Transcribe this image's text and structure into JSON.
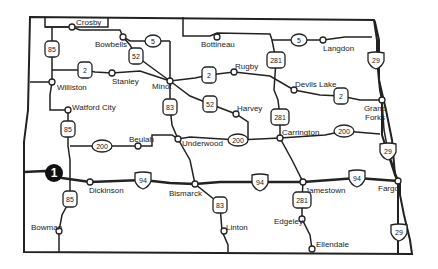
{
  "map": {
    "title": "North Dakota highway map",
    "marker": {
      "label": "1",
      "x": 54,
      "y": 173
    },
    "cities": [
      {
        "name": "Crosby",
        "x": 72,
        "y": 27,
        "lx": 76,
        "ly": 18
      },
      {
        "name": "Bowbells",
        "x": 123,
        "y": 37,
        "lx": 95,
        "ly": 40
      },
      {
        "name": "Bottineau",
        "x": 217,
        "y": 37,
        "lx": 201,
        "ly": 40
      },
      {
        "name": "Langdon",
        "x": 323,
        "y": 40,
        "lx": 323,
        "ly": 44
      },
      {
        "name": "Williston",
        "x": 52,
        "y": 82,
        "lx": 57,
        "ly": 83
      },
      {
        "name": "Stanley",
        "x": 112,
        "y": 73,
        "lx": 112,
        "ly": 77
      },
      {
        "name": "Minot",
        "x": 170,
        "y": 81,
        "lx": 152,
        "ly": 82
      },
      {
        "name": "Rugby",
        "x": 234,
        "y": 72,
        "lx": 235,
        "ly": 62
      },
      {
        "name": "Devils Lake",
        "x": 294,
        "y": 90,
        "lx": 295,
        "ly": 80
      },
      {
        "name": "Grand Forks",
        "x": 382,
        "y": 100,
        "lx": 361,
        "ly": 104
      },
      {
        "name": "Watford City",
        "x": 68,
        "y": 110,
        "lx": 72,
        "ly": 103
      },
      {
        "name": "Harvey",
        "x": 236,
        "y": 114,
        "lx": 237,
        "ly": 104
      },
      {
        "name": "Carrington",
        "x": 280,
        "y": 138,
        "lx": 282,
        "ly": 128
      },
      {
        "name": "Beulah",
        "x": 138,
        "y": 146,
        "lx": 129,
        "ly": 135
      },
      {
        "name": "Underwood",
        "x": 178,
        "y": 139,
        "lx": 182,
        "ly": 139
      },
      {
        "name": "Dickinson",
        "x": 90,
        "y": 182,
        "lx": 89,
        "ly": 186
      },
      {
        "name": "Bismarck",
        "x": 195,
        "y": 184,
        "lx": 169,
        "ly": 189
      },
      {
        "name": "Jamestown",
        "x": 303,
        "y": 182,
        "lx": 305,
        "ly": 186
      },
      {
        "name": "Fargo",
        "x": 398,
        "y": 181,
        "lx": 378,
        "ly": 184
      },
      {
        "name": "Bowman",
        "x": 59,
        "y": 231,
        "lx": 31,
        "ly": 223
      },
      {
        "name": "Linton",
        "x": 224,
        "y": 231,
        "lx": 226,
        "ly": 223
      },
      {
        "name": "Edgeley",
        "x": 302,
        "y": 219,
        "lx": 274,
        "ly": 217
      },
      {
        "name": "Ellendale",
        "x": 312,
        "y": 249,
        "lx": 316,
        "ly": 240
      }
    ],
    "shields": [
      {
        "route": "85",
        "type": "us",
        "x": 52,
        "y": 49
      },
      {
        "route": "85",
        "type": "us",
        "x": 68,
        "y": 129
      },
      {
        "route": "85",
        "type": "us",
        "x": 70,
        "y": 199
      },
      {
        "route": "5",
        "type": "state",
        "x": 153,
        "y": 41
      },
      {
        "route": "5",
        "type": "state",
        "x": 299,
        "y": 40
      },
      {
        "route": "52",
        "type": "us",
        "x": 136,
        "y": 56
      },
      {
        "route": "52",
        "type": "us",
        "x": 210,
        "y": 104
      },
      {
        "route": "2",
        "type": "us",
        "x": 85,
        "y": 70
      },
      {
        "route": "2",
        "type": "us",
        "x": 209,
        "y": 75
      },
      {
        "route": "2",
        "type": "us",
        "x": 341,
        "y": 96
      },
      {
        "route": "281",
        "type": "us",
        "x": 276,
        "y": 60
      },
      {
        "route": "281",
        "type": "us",
        "x": 280,
        "y": 117
      },
      {
        "route": "281",
        "type": "us",
        "x": 302,
        "y": 200
      },
      {
        "route": "83",
        "type": "us",
        "x": 170,
        "y": 107
      },
      {
        "route": "83",
        "type": "us",
        "x": 220,
        "y": 205
      },
      {
        "route": "200",
        "type": "state",
        "x": 102,
        "y": 146
      },
      {
        "route": "200",
        "type": "state",
        "x": 238,
        "y": 140
      },
      {
        "route": "200",
        "type": "state",
        "x": 344,
        "y": 131
      },
      {
        "route": "29",
        "type": "interstate",
        "x": 376,
        "y": 60
      },
      {
        "route": "29",
        "type": "interstate",
        "x": 388,
        "y": 151
      },
      {
        "route": "29",
        "type": "interstate",
        "x": 399,
        "y": 232
      },
      {
        "route": "94",
        "type": "interstate",
        "x": 143,
        "y": 180
      },
      {
        "route": "94",
        "type": "interstate",
        "x": 260,
        "y": 182
      },
      {
        "route": "94",
        "type": "interstate",
        "x": 357,
        "y": 178
      }
    ]
  }
}
